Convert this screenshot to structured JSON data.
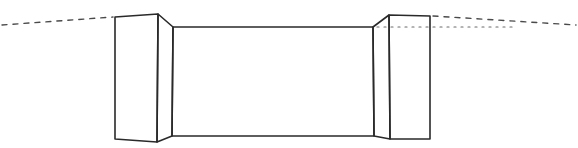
{
  "diagram": {
    "type": "hand-drawn perspective sketch",
    "colors": {
      "background": "#ffffff",
      "ink": "#2a2a2a",
      "dash_ink": "#4a4a4a",
      "dot_ink": "#6a6a6a"
    },
    "stroke_width": 1.6,
    "shapes": {
      "left_pillar_front": "115,17 158,14 157,142 115,139",
      "left_pillar_side": "158,14 173,27 172,136 157,142",
      "back_wall": "173,27 373,27 374,136 172,136",
      "right_pillar_side": "373,27 389,15 390,139 374,136",
      "right_pillar_front": "389,15 430,16 430,139 390,139"
    },
    "guide_lines": {
      "left_horizon_dashed": {
        "x1": 2,
        "y1": 25,
        "x2": 113,
        "y2": 17,
        "dash": "5 6"
      },
      "right_horizon_dashed": {
        "x1": 433,
        "y1": 16,
        "x2": 576,
        "y2": 25,
        "dash": "5 6"
      },
      "right_eye_level_dotted": {
        "x1": 377,
        "y1": 27,
        "x2": 512,
        "y2": 27,
        "dash": "2 5"
      }
    }
  }
}
